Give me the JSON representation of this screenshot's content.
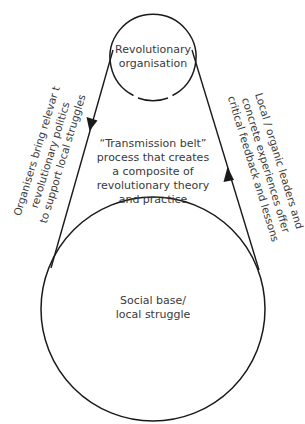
{
  "diagram": {
    "type": "cycle",
    "nodes": [
      {
        "id": "revolutionary-organisation",
        "lines": [
          "Revolutionary",
          "organisation"
        ],
        "shape": "circle",
        "cx": 153,
        "cy": 57,
        "r": 43
      },
      {
        "id": "social-base",
        "lines": [
          "Social base/",
          "local struggle"
        ],
        "shape": "circle",
        "cx": 153,
        "cy": 309,
        "r": 112
      }
    ],
    "center_label": {
      "lines": [
        "“Transmission belt”",
        "process that creates",
        "a composite of",
        "revolutionary theory",
        "and practice"
      ]
    },
    "edges": [
      {
        "id": "downward-edge",
        "from": "revolutionary-organisation",
        "to": "social-base",
        "direction": "down",
        "lines": [
          "Organisers bring relevar t",
          "revolutionary politics",
          "to support local struggles"
        ]
      },
      {
        "id": "upward-edge",
        "from": "social-base",
        "to": "revolutionary-organisation",
        "direction": "up",
        "lines": [
          "Local / organic leaders and",
          "concrete experiences offer",
          "critical feedback and lessons"
        ]
      }
    ],
    "colors": {
      "stroke": "#1a1a1a",
      "text": "#3a3a3a",
      "background": "#ffffff"
    }
  }
}
